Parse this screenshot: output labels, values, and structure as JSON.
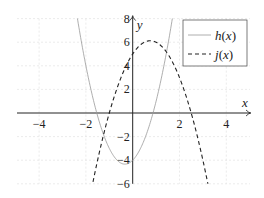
{
  "chart_data": {
    "type": "line",
    "title": "",
    "xlabel": "x",
    "ylabel": "y",
    "xlim": [
      -5,
      5
    ],
    "ylim": [
      -6,
      8
    ],
    "xticks": [
      -4,
      -2,
      2,
      4
    ],
    "yticks": [
      -6,
      -4,
      -2,
      2,
      4,
      6,
      8
    ],
    "xtick_labels": [
      "−4",
      "−2",
      "2",
      "4"
    ],
    "ytick_labels": [
      "−6",
      "−4",
      "−2",
      "2",
      "4",
      "6",
      "8"
    ],
    "grid": true,
    "legend_position": "upper right",
    "series": [
      {
        "name": "h(x)",
        "label_fn": "h",
        "style": "solid",
        "color": "#999999",
        "formula": "3x^2 + 2x - 4",
        "coeffs": [
          3,
          2,
          -4
        ],
        "key_points": [
          {
            "x": -1.54,
            "y": 0
          },
          {
            "x": -0.33,
            "y": -4.33
          },
          {
            "x": 0,
            "y": -4
          },
          {
            "x": 0.87,
            "y": 0
          }
        ]
      },
      {
        "name": "j(x)",
        "label_fn": "j",
        "style": "dashed",
        "color": "#222222",
        "formula": "-2x^2 + 3x + 5",
        "coeffs": [
          -2,
          3,
          5
        ],
        "key_points": [
          {
            "x": -1,
            "y": 0
          },
          {
            "x": 0,
            "y": 5
          },
          {
            "x": 0.75,
            "y": 6.125
          },
          {
            "x": 2.5,
            "y": 0
          }
        ]
      }
    ]
  },
  "legend": {
    "items": [
      {
        "fn": "h",
        "arg": "(x)"
      },
      {
        "fn": "j",
        "arg": "(x)"
      }
    ]
  }
}
